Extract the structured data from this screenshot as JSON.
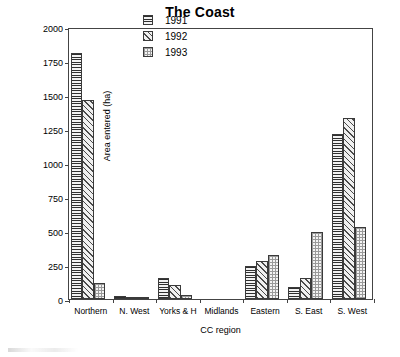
{
  "chart_data": {
    "type": "bar",
    "title": "The Coast",
    "xlabel": "CC region",
    "ylabel": "Area entered (ha)",
    "categories": [
      "Northern",
      "N. West",
      "Yorks & H",
      "Midlands",
      "Eastern",
      "S. East",
      "S. West"
    ],
    "series": [
      {
        "name": "1991",
        "pattern": "horizontal-lines",
        "values": [
          1810,
          25,
          155,
          0,
          245,
          85,
          1210
        ]
      },
      {
        "name": "1992",
        "pattern": "diagonal-hatch",
        "values": [
          1465,
          8,
          100,
          0,
          280,
          155,
          1330
        ]
      },
      {
        "name": "1993",
        "pattern": "dotted-grid",
        "values": [
          120,
          2,
          30,
          0,
          320,
          490,
          530
        ]
      }
    ],
    "ylim": [
      0,
      2000
    ],
    "yticks": [
      0,
      250,
      500,
      750,
      1000,
      1250,
      1500,
      1750,
      2000
    ],
    "ytick_labels": [
      "0",
      "250",
      "500",
      "750",
      "1000",
      "1250",
      "1500",
      "1750",
      "2000"
    ],
    "grid": false,
    "legend_position": "top-center",
    "legend_entries": [
      "1991",
      "1992",
      "1993"
    ]
  }
}
